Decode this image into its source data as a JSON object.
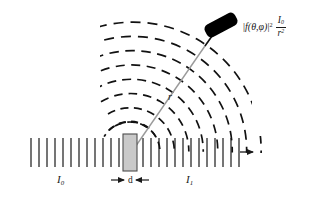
{
  "diagram": {
    "labels": {
      "incident_intensity": "I",
      "incident_intensity_sub": "0",
      "transmitted_intensity": "I",
      "transmitted_intensity_sub": "1",
      "thickness": "d",
      "distance": "r"
    },
    "formula": {
      "amplitude_open": "|",
      "amplitude_fn": "f",
      "amplitude_args": "(θ,φ)",
      "amplitude_close": "|",
      "amplitude_exp": "2",
      "frac_num": "I",
      "frac_num_sub": "0",
      "frac_den": "r",
      "frac_den_exp": "2"
    },
    "icon_names": {
      "detector": "detector-icon",
      "sample": "sample-slab",
      "beam": "beam-hatch",
      "waves": "scattered-wave-arcs",
      "ray": "scattering-ray",
      "arrow_in": "beam-in-arrow",
      "arrow_out": "beam-out-arrow"
    },
    "colors": {
      "ink": "#1a1a1a",
      "sample_fill": "#c9c9c9",
      "sample_stroke": "#4d4d4d",
      "ray": "#8c8c8c",
      "detector": "#000000",
      "background": "#ffffff"
    },
    "geometry": {
      "beam_axis_y": 152,
      "beam_left_x": 18,
      "beam_right_x": 252,
      "hatch_top_y": 138,
      "hatch_bottom_y": 167,
      "hatch_count_left": 12,
      "hatch_count_right": 13,
      "sample_x": 123,
      "sample_y": 134,
      "sample_w": 14,
      "sample_h": 37,
      "source_x": 130,
      "source_y": 152,
      "detector_x": 218,
      "detector_y": 25,
      "ray_angle_deg": -61,
      "arc_count": 8,
      "arc_radii": [
        30,
        44,
        58,
        72,
        86,
        100,
        114,
        128
      ]
    }
  }
}
